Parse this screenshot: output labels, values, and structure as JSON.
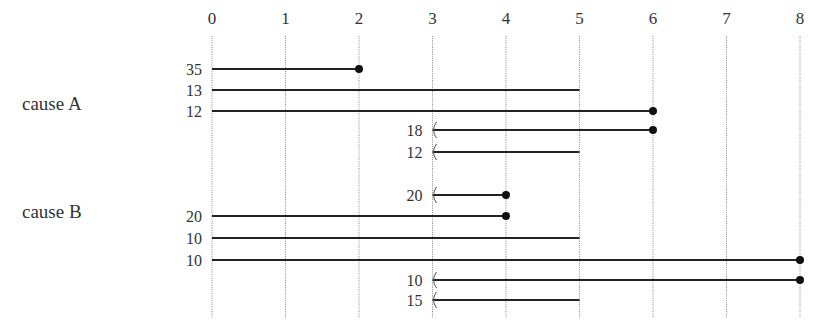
{
  "chart_data": {
    "type": "timeline",
    "title": "",
    "xlabel": "",
    "ylabel": "",
    "x_ticks": [
      "0",
      "1",
      "2",
      "3",
      "4",
      "5",
      "6",
      "7",
      "8"
    ],
    "xlim": [
      0,
      8
    ],
    "grid": "vertical dotted lines at each integer",
    "marker_legend": {
      "dot": "event (failure) at end",
      "open_end": "censored at end (no marker)",
      "left_bracket": "left-truncated / delayed entry at start"
    },
    "groups": [
      {
        "name": "cause A",
        "rows": [
          {
            "count": 35,
            "start": 0,
            "end": 2,
            "start_marker": "none",
            "end_marker": "dot"
          },
          {
            "count": 13,
            "start": 0,
            "end": 5,
            "start_marker": "none",
            "end_marker": "none"
          },
          {
            "count": 12,
            "start": 0,
            "end": 6,
            "start_marker": "none",
            "end_marker": "dot"
          },
          {
            "count": 18,
            "start": 3,
            "end": 6,
            "start_marker": "bracket",
            "end_marker": "dot"
          },
          {
            "count": 12,
            "start": 3,
            "end": 5,
            "start_marker": "bracket",
            "end_marker": "none"
          }
        ]
      },
      {
        "name": "cause B",
        "rows": [
          {
            "count": 20,
            "start": 3,
            "end": 4,
            "start_marker": "bracket",
            "end_marker": "dot"
          },
          {
            "count": 20,
            "start": 0,
            "end": 4,
            "start_marker": "none",
            "end_marker": "dot"
          },
          {
            "count": 10,
            "start": 0,
            "end": 5,
            "start_marker": "none",
            "end_marker": "none"
          },
          {
            "count": 10,
            "start": 0,
            "end": 8,
            "start_marker": "none",
            "end_marker": "dot"
          },
          {
            "count": 10,
            "start": 3,
            "end": 8,
            "start_marker": "bracket",
            "end_marker": "dot"
          },
          {
            "count": 15,
            "start": 3,
            "end": 5,
            "start_marker": "bracket",
            "end_marker": "none"
          }
        ]
      }
    ]
  },
  "layout": {
    "x0": 212,
    "x_step": 73.5,
    "axis_label_y": 24,
    "grid_top": 36,
    "grid_bottom": 318,
    "group_label_x": 22,
    "group_label_y": [
      110,
      218
    ],
    "row_y": [
      [
        69,
        90,
        111,
        130,
        152
      ],
      [
        195,
        216,
        238,
        260,
        280,
        300
      ]
    ],
    "line_color": "#222222",
    "grid_color": "#888888"
  }
}
